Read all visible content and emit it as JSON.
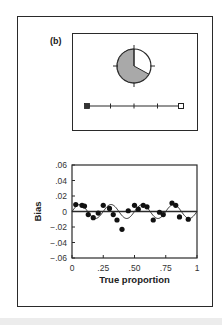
{
  "panel_label": "(b)",
  "pie": {
    "filled_fraction": 0.67,
    "fill_color": "#a9a9a9",
    "empty_color": "#ffffff"
  },
  "slider": {
    "ticks": 5,
    "left_marker": "filled-square",
    "right_marker": "hollow-square"
  },
  "chart_data": {
    "type": "scatter",
    "title": "",
    "xlabel": "True proportion",
    "ylabel": "Bias",
    "xlim": [
      0,
      1
    ],
    "ylim": [
      -0.06,
      0.06
    ],
    "x_ticks": [
      "0",
      ".25",
      ".50",
      ".75",
      "1"
    ],
    "y_ticks": [
      ".06",
      ".04",
      ".02",
      "0",
      "−.02",
      "−.04",
      "−.06"
    ],
    "grid": false,
    "reference_line": 0,
    "series": [
      {
        "name": "observed bias",
        "kind": "points",
        "x": [
          0.03,
          0.08,
          0.1,
          0.13,
          0.17,
          0.21,
          0.25,
          0.3,
          0.33,
          0.36,
          0.4,
          0.45,
          0.5,
          0.53,
          0.57,
          0.6,
          0.65,
          0.7,
          0.73,
          0.8,
          0.83,
          0.86,
          0.93
        ],
        "y": [
          0.009,
          0.008,
          0.007,
          -0.004,
          -0.008,
          -0.002,
          0.008,
          0.004,
          -0.004,
          -0.011,
          -0.023,
          0.001,
          0.008,
          0.003,
          0.008,
          0.006,
          -0.011,
          -0.001,
          -0.004,
          0.011,
          0.008,
          -0.007,
          -0.01
        ]
      },
      {
        "name": "predicted bias",
        "kind": "curve",
        "function": "0.009*sin(2*pi*x/0.25)",
        "period": 0.25,
        "amplitude": 0.009
      }
    ]
  }
}
